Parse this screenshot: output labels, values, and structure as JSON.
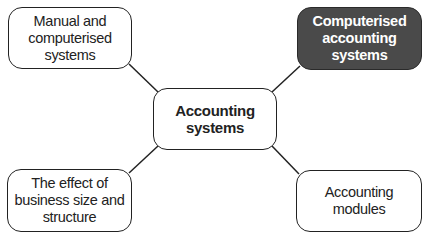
{
  "diagram": {
    "type": "mind-map",
    "center": {
      "label": "Accounting\nsystems"
    },
    "nodes": [
      {
        "id": "top-left",
        "label": "Manual and\ncomputerised\nsystems",
        "highlighted": false
      },
      {
        "id": "top-right",
        "label": "Computerised\naccounting\nsystems",
        "highlighted": true
      },
      {
        "id": "bottom-left",
        "label": "The effect of\nbusiness size and\nstructure",
        "highlighted": false
      },
      {
        "id": "bottom-right",
        "label": "Accounting\nmodules",
        "highlighted": false
      }
    ],
    "colors": {
      "highlight_fill": "#4a4a4a",
      "border": "#222222",
      "background": "#ffffff"
    }
  }
}
